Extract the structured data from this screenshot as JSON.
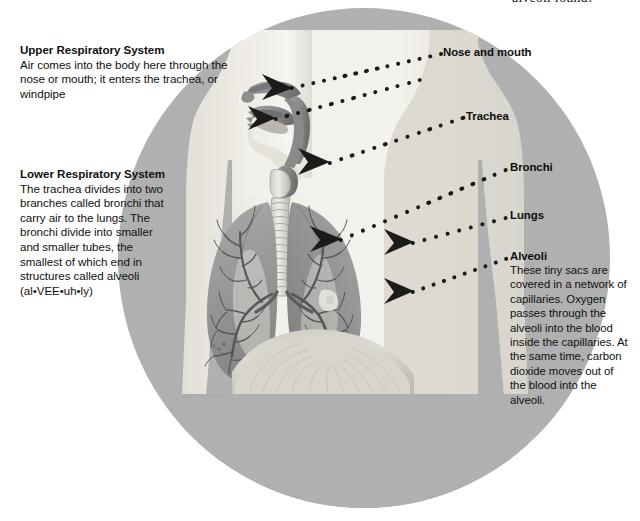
{
  "page": {
    "top_cut_caption": "alveoli found?",
    "background_color": "#ffffff",
    "circle_color": "#b0b0b0",
    "label_color": "#0d0d0d"
  },
  "text_blocks": {
    "upper": {
      "heading": "Upper Respiratory System",
      "body": "Air comes into the body here through the nose or mouth; it enters the trachea, or windpipe"
    },
    "lower": {
      "heading": "Lower Respiratory System",
      "body": "The trachea divides into two branches called bronchi that carry air to the lungs. The bronchi divide into smaller and smaller tubes, the smallest of which end in structures called alveoli (al•VEE•uh•ly)"
    }
  },
  "callouts": [
    {
      "id": "nose",
      "label": "Nose and mouth",
      "body": ""
    },
    {
      "id": "trachea",
      "label": "Trachea",
      "body": ""
    },
    {
      "id": "bronchi",
      "label": "Bronchi",
      "body": ""
    },
    {
      "id": "lungs",
      "label": "Lungs",
      "body": ""
    },
    {
      "id": "alveoli",
      "label": "Alveoli",
      "body": "These tiny sacs are covered in a network of capillaries. Oxygen passes through the alveoli into the blood inside the capillaries. At the same time, carbon dioxide moves out of the blood into the alveoli."
    }
  ],
  "figure": {
    "parts": [
      "head",
      "nasal-cavity",
      "mouth",
      "pharynx",
      "larynx",
      "trachea",
      "bronchi",
      "left-lung",
      "right-lung",
      "bronchial-tree",
      "diaphragm",
      "torso",
      "arms"
    ],
    "colors": {
      "body_light": "#eeece6",
      "body_shadow": "#d6d3cb",
      "airway": "#8e8e8e",
      "airway_dark": "#6f6f6f",
      "lung": "#9b9b9b",
      "lung_dark": "#7d7d7d",
      "tree": "#5d5d5d",
      "dot": "#181818"
    }
  }
}
